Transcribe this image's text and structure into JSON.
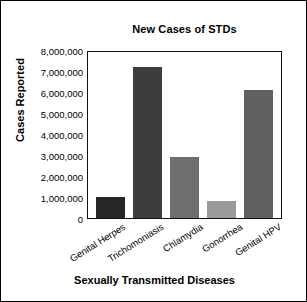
{
  "chart_data": {
    "type": "bar",
    "title": "New Cases of STDs",
    "xlabel": "Sexually Transmitted Diseases",
    "ylabel": "Cases Reported",
    "categories": [
      "Genital Herpes",
      "Trichomoniasis",
      "Chlamydia",
      "Gonorrhea",
      "Genital HPV"
    ],
    "values": [
      1000000,
      7200000,
      2900000,
      800000,
      6100000
    ],
    "bar_colors": [
      "#262626",
      "#3d3d3d",
      "#6e6e6e",
      "#9a9a9a",
      "#606060"
    ],
    "ylim": [
      0,
      8000000
    ],
    "ytick_values": [
      0,
      1000000,
      2000000,
      3000000,
      4000000,
      5000000,
      6000000,
      7000000,
      8000000
    ],
    "ytick_labels": [
      "0",
      "1,000,000",
      "2,000,000",
      "3,000,000",
      "4,000,000",
      "5,000,000",
      "6,000,000",
      "7,000,000",
      "8,000,000"
    ],
    "grid": false,
    "legend": "none",
    "frame_color": "#111111",
    "background_color": "#ffffff"
  }
}
